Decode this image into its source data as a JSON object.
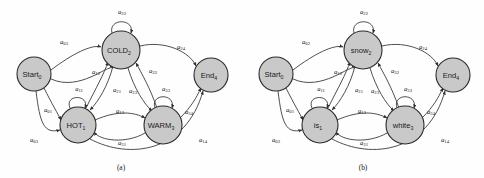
{
  "figure": {
    "type": "diagram",
    "panels": [
      {
        "id": "a",
        "caption": "(a)",
        "nodes": [
          {
            "id": "start",
            "base": "Start",
            "sub": "0",
            "cx": 34,
            "cy": 74,
            "r": 17
          },
          {
            "id": "cold",
            "base": "COLD",
            "sub": "2",
            "cx": 121,
            "cy": 50,
            "r": 19
          },
          {
            "id": "hot",
            "base": "HOT",
            "sub": "1",
            "cx": 78,
            "cy": 125,
            "r": 18
          },
          {
            "id": "warm",
            "base": "WARM",
            "sub": "3",
            "cx": 163,
            "cy": 125,
            "r": 19
          },
          {
            "id": "end",
            "base": "End",
            "sub": "4",
            "cx": 211,
            "cy": 75,
            "r": 17
          }
        ],
        "edge_labels": [
          {
            "base": "a",
            "sub": "03",
            "x": 64,
            "y": 42
          },
          {
            "base": "a",
            "sub": "22",
            "x": 122,
            "y": 12
          },
          {
            "base": "a",
            "sub": "24",
            "x": 181,
            "y": 47
          },
          {
            "base": "a",
            "sub": "12",
            "x": 96,
            "y": 72
          },
          {
            "base": "a",
            "sub": "21",
            "x": 117,
            "y": 90
          },
          {
            "base": "a",
            "sub": "23",
            "x": 133,
            "y": 91
          },
          {
            "base": "a",
            "sub": "32",
            "x": 153,
            "y": 71
          },
          {
            "base": "a",
            "sub": "11",
            "x": 79,
            "y": 89
          },
          {
            "base": "a",
            "sub": "33",
            "x": 166,
            "y": 89
          },
          {
            "base": "a",
            "sub": "13",
            "x": 120,
            "y": 111
          },
          {
            "base": "a",
            "sub": "31",
            "x": 122,
            "y": 143
          },
          {
            "base": "a",
            "sub": "34",
            "x": 189,
            "y": 112
          },
          {
            "base": "a",
            "sub": "14",
            "x": 203,
            "y": 140
          },
          {
            "base": "a",
            "sub": "01",
            "x": 48,
            "y": 110
          },
          {
            "base": "a",
            "sub": "03",
            "x": 34,
            "y": 140
          }
        ]
      },
      {
        "id": "b",
        "caption": "(b)",
        "nodes": [
          {
            "id": "start",
            "base": "Start",
            "sub": "0",
            "cx": 34,
            "cy": 74,
            "r": 17
          },
          {
            "id": "snow",
            "base": "snow",
            "sub": "2",
            "cx": 121,
            "cy": 50,
            "r": 19
          },
          {
            "id": "is",
            "base": "is",
            "sub": "1",
            "cx": 78,
            "cy": 125,
            "r": 18
          },
          {
            "id": "white",
            "base": "white",
            "sub": "3",
            "cx": 163,
            "cy": 125,
            "r": 19
          },
          {
            "id": "end",
            "base": "End",
            "sub": "4",
            "cx": 211,
            "cy": 75,
            "r": 17
          }
        ],
        "edge_labels": [
          {
            "base": "a",
            "sub": "02",
            "x": 64,
            "y": 42
          },
          {
            "base": "a",
            "sub": "22",
            "x": 122,
            "y": 12
          },
          {
            "base": "a",
            "sub": "24",
            "x": 181,
            "y": 47
          },
          {
            "base": "a",
            "sub": "12",
            "x": 96,
            "y": 72
          },
          {
            "base": "a",
            "sub": "21",
            "x": 117,
            "y": 90
          },
          {
            "base": "a",
            "sub": "23",
            "x": 133,
            "y": 91
          },
          {
            "base": "a",
            "sub": "32",
            "x": 153,
            "y": 71
          },
          {
            "base": "a",
            "sub": "11",
            "x": 79,
            "y": 89
          },
          {
            "base": "a",
            "sub": "33",
            "x": 166,
            "y": 89
          },
          {
            "base": "a",
            "sub": "13",
            "x": 120,
            "y": 111
          },
          {
            "base": "a",
            "sub": "31",
            "x": 122,
            "y": 143
          },
          {
            "base": "a",
            "sub": "34",
            "x": 189,
            "y": 112
          },
          {
            "base": "a",
            "sub": "14",
            "x": 203,
            "y": 140
          },
          {
            "base": "a",
            "sub": "01",
            "x": 48,
            "y": 110
          },
          {
            "base": "a",
            "sub": "03",
            "x": 34,
            "y": 140
          }
        ]
      }
    ],
    "colors": {
      "node_fill": "#c9c9c9",
      "node_stroke": "#2b2b2b",
      "edge": "#2f2f2f",
      "text": "#111111",
      "background": "#ffffff"
    }
  }
}
